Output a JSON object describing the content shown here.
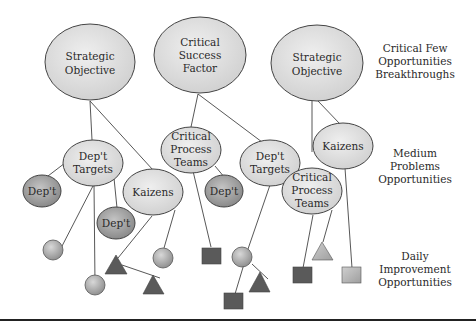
{
  "diagram": {
    "top_nodes": [
      {
        "id": "so1",
        "lines": [
          "Strategic",
          "Objective"
        ]
      },
      {
        "id": "csf",
        "lines": [
          "Critical",
          "Success",
          "Factor"
        ]
      },
      {
        "id": "so2",
        "lines": [
          "Strategic",
          "Objective"
        ]
      }
    ],
    "mid_nodes": [
      {
        "id": "dt1",
        "lines": [
          "Dep't",
          "Targets"
        ]
      },
      {
        "id": "d1",
        "lines": [
          "Dep't"
        ]
      },
      {
        "id": "k1",
        "lines": [
          "Kaizens"
        ]
      },
      {
        "id": "d2",
        "lines": [
          "Dep't"
        ]
      },
      {
        "id": "cpt1",
        "lines": [
          "Critical",
          "Process",
          "Teams"
        ]
      },
      {
        "id": "d3",
        "lines": [
          "Dep't"
        ]
      },
      {
        "id": "dt2",
        "lines": [
          "Dep't",
          "Targets"
        ]
      },
      {
        "id": "k2",
        "lines": [
          "Kaizens"
        ]
      },
      {
        "id": "cpt2",
        "lines": [
          "Critical",
          "Process",
          "Teams"
        ]
      }
    ],
    "side_labels": [
      {
        "level": "top",
        "lines": [
          "Critical Few",
          "Opportunities",
          "Breakthroughs"
        ]
      },
      {
        "level": "medium",
        "lines": [
          "Medium",
          "Problems",
          "Opportunities"
        ]
      },
      {
        "level": "daily",
        "lines": [
          "Daily",
          "Improvement",
          "Opportunities"
        ]
      }
    ],
    "colors": {
      "light_fill": "#dcdcdc",
      "dark_fill": "#9a9a9a",
      "shape_dark": "#5a5a5a",
      "shape_light": "#b8b8b8",
      "stroke": "#444444",
      "rule": "#222222"
    }
  }
}
